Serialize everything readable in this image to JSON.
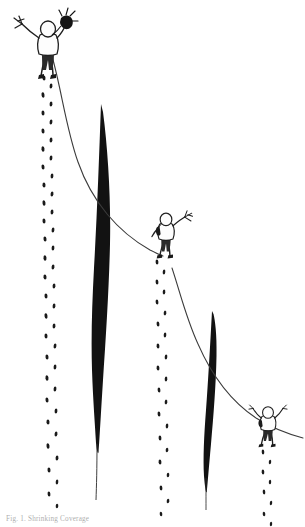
{
  "image": {
    "title": "Three figures descending a slope with footprint trails",
    "medium": "pen-and-ink line drawing",
    "background_color": "#ffffff",
    "ink_color": "#1a1a1a",
    "width": 305,
    "height": 527
  },
  "caption": {
    "text": "Fig. 1. Shrinking Coverage",
    "legible": false,
    "note": "cut off at bottom edge of image"
  },
  "figures": [
    {
      "id": "figure-top-left",
      "label": "hooded figure with outstretched arm",
      "x": 48,
      "y": 40,
      "scale": 1.0,
      "arm_left": "extended, holding small spiky object",
      "arm_right": "raised near dark pack",
      "has_backpack": true
    },
    {
      "id": "figure-middle",
      "label": "hooded figure with raised arm",
      "x": 166,
      "y": 228,
      "scale": 0.72,
      "arm_left": "lowered",
      "arm_right": "raised, holding small spiky object",
      "has_backpack": true
    },
    {
      "id": "figure-lower-right",
      "label": "hooded figure with both arms raised",
      "x": 268,
      "y": 420,
      "scale": 0.62,
      "arm_left": "raised",
      "arm_right": "raised",
      "has_backpack": true
    }
  ],
  "footprint_trails": [
    {
      "id": "trail-left",
      "from_figure": "figure-top-left",
      "start_x": 46,
      "start_y": 70,
      "end_x": 52,
      "end_y": 512,
      "step_count": 34,
      "drift_x": 8
    },
    {
      "id": "trail-middle",
      "from_figure": "figure-middle",
      "start_x": 161,
      "start_y": 256,
      "end_x": 166,
      "end_y": 516,
      "step_count": 21,
      "drift_x": 6
    },
    {
      "id": "trail-right",
      "from_figure": "figure-lower-right",
      "start_x": 266,
      "start_y": 446,
      "end_x": 272,
      "end_y": 520,
      "step_count": 8,
      "drift_x": 5
    }
  ],
  "dark_shapes": [
    {
      "id": "blade-left",
      "label": "tall tapered black form",
      "tip_x": 101,
      "tip_y": 104,
      "widest_x": 96,
      "widest_y": 300,
      "max_width": 20,
      "base_x": 96,
      "base_y": 448
    },
    {
      "id": "blade-right",
      "label": "short tapered black form",
      "tip_x": 212,
      "tip_y": 311,
      "widest_x": 209,
      "widest_y": 430,
      "max_width": 13,
      "base_x": 210,
      "base_y": 505
    }
  ],
  "connecting_curve": {
    "id": "rope-curve",
    "label": "sweeping line linking the three figures",
    "stroke_width": 1.1,
    "waypoints": [
      {
        "x": 55,
        "y": 60
      },
      {
        "x": 72,
        "y": 140
      },
      {
        "x": 120,
        "y": 230
      },
      {
        "x": 160,
        "y": 258
      },
      {
        "x": 176,
        "y": 276
      },
      {
        "x": 196,
        "y": 340
      },
      {
        "x": 232,
        "y": 408
      },
      {
        "x": 258,
        "y": 424
      },
      {
        "x": 296,
        "y": 438
      }
    ]
  }
}
